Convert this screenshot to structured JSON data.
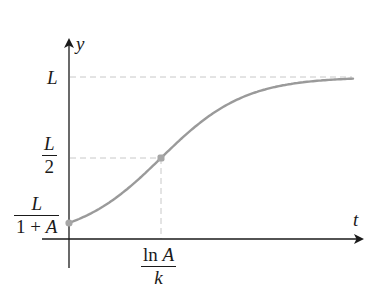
{
  "diagram": {
    "axes": {
      "x_label": "t",
      "y_label": "y"
    },
    "y_ticks": [
      {
        "id": "L",
        "label": "L"
      },
      {
        "id": "half",
        "numerator": "L",
        "denominator": "2"
      },
      {
        "id": "initial",
        "numerator": "L",
        "denominator_parts": [
          "1 + ",
          "A"
        ]
      }
    ],
    "x_ticks": [
      {
        "id": "inflection",
        "numerator_parts": [
          "ln ",
          "A"
        ],
        "denominator": "k"
      }
    ],
    "points": [
      {
        "name": "initial-value",
        "t": 0,
        "y_expr": "L/(1+A)"
      },
      {
        "name": "inflection-point",
        "t_expr": "ln A / k",
        "y_expr": "L/2"
      }
    ],
    "colors": {
      "curve": "#9a9a9a",
      "points": "#a6a6a6",
      "guides": "#c8c8c8",
      "axes": "#1a1a1a"
    }
  },
  "chart_data": {
    "type": "line",
    "title": "",
    "xlabel": "t",
    "ylabel": "y",
    "function": "y = L / (1 + A e^{-k t})",
    "params_illustrative": {
      "L": 1,
      "A": 9,
      "k": 0.0239
    },
    "series": [
      {
        "name": "logistic curve",
        "x": [
          0,
          0.5,
          1,
          1.5,
          2,
          2.5,
          3,
          3.5,
          4,
          4.5,
          5,
          5.5,
          6,
          6.5,
          7
        ],
        "values": [
          0.1,
          0.15,
          0.23,
          0.33,
          0.45,
          0.57,
          0.69,
          0.79,
          0.86,
          0.91,
          0.94,
          0.96,
          0.98,
          0.99,
          0.99
        ]
      }
    ],
    "annotations": [
      "L (horizontal asymptote, dashed)",
      "L/2 at t = ln A / k (inflection point, dashed guides)",
      "L/(1+A) at t = 0 (initial value)"
    ],
    "grid": false,
    "legend": "none"
  }
}
